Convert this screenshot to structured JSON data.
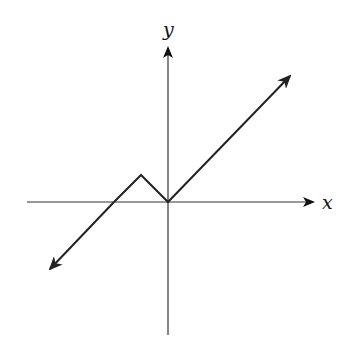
{
  "diagram": {
    "type": "coordinate-graph",
    "axes": {
      "x_label": "x",
      "y_label": "y"
    },
    "colors": {
      "axis": "#333333",
      "curve": "#222222",
      "background": "#ffffff"
    },
    "curve_points_px": [
      [
        50,
        270
      ],
      [
        114,
        202
      ],
      [
        141,
        175
      ],
      [
        168,
        202
      ],
      [
        290,
        76
      ]
    ],
    "features": {
      "left_ray": "arrow extending down-left with slope 1",
      "peak": "local maximum left of origin",
      "vertex": "local minimum at origin",
      "right_ray": "arrow extending up-right with slope 1"
    }
  }
}
